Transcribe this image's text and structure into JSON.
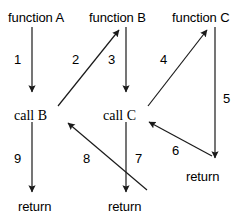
{
  "diagram": {
    "type": "call-sequence-flow",
    "background_color": "#ffffff",
    "stroke_color": "#1a1a1a",
    "text_color": "#000000",
    "nodes": [
      {
        "id": "function-a",
        "label": "function A",
        "x": 8,
        "y": 11,
        "font": "sans"
      },
      {
        "id": "function-b",
        "label": "function B",
        "x": 89,
        "y": 11,
        "font": "sans"
      },
      {
        "id": "function-c",
        "label": "function C",
        "x": 172,
        "y": 11,
        "font": "sans"
      },
      {
        "id": "call-b",
        "label": "call B",
        "x": 14,
        "y": 109,
        "font": "serif"
      },
      {
        "id": "call-c",
        "label": "call C",
        "x": 103,
        "y": 109,
        "font": "serif"
      },
      {
        "id": "return-left",
        "label": "return",
        "x": 18,
        "y": 200,
        "font": "sans"
      },
      {
        "id": "return-middle",
        "label": "return",
        "x": 108,
        "y": 200,
        "font": "sans"
      },
      {
        "id": "return-right",
        "label": "return",
        "x": 186,
        "y": 170,
        "font": "sans"
      }
    ],
    "edges": [
      {
        "id": "edge-1",
        "number": "1",
        "from": "function-a",
        "to": "call-b",
        "x1": 32,
        "y1": 27,
        "x2": 32,
        "y2": 92,
        "label_x": 14,
        "label_y": 53
      },
      {
        "id": "edge-2",
        "number": "2",
        "from": "call-b",
        "to": "function-b",
        "x1": 58,
        "y1": 106,
        "x2": 119,
        "y2": 30,
        "label_x": 72,
        "label_y": 53
      },
      {
        "id": "edge-3",
        "number": "3",
        "from": "function-b",
        "to": "call-c",
        "x1": 126,
        "y1": 27,
        "x2": 126,
        "y2": 92,
        "label_x": 108,
        "label_y": 53
      },
      {
        "id": "edge-4",
        "number": "4",
        "from": "call-c",
        "to": "function-c",
        "x1": 148,
        "y1": 106,
        "x2": 207,
        "y2": 30,
        "label_x": 160,
        "label_y": 53
      },
      {
        "id": "edge-5",
        "number": "5",
        "from": "function-c",
        "to": "return-right",
        "x1": 215,
        "y1": 27,
        "x2": 215,
        "y2": 158,
        "label_x": 223,
        "label_y": 92
      },
      {
        "id": "edge-6",
        "number": "6",
        "from": "return-right",
        "to": "call-c",
        "x1": 212,
        "y1": 156,
        "x2": 149,
        "y2": 122,
        "label_x": 172,
        "label_y": 144
      },
      {
        "id": "edge-7",
        "number": "7",
        "from": "call-c",
        "to": "return-middle",
        "x1": 126,
        "y1": 122,
        "x2": 126,
        "y2": 192,
        "label_x": 135,
        "label_y": 152
      },
      {
        "id": "edge-8",
        "number": "8",
        "from": "return-middle",
        "to": "call-b",
        "x1": 147,
        "y1": 190,
        "x2": 68,
        "y2": 123,
        "label_x": 83,
        "label_y": 152
      },
      {
        "id": "edge-9",
        "number": "9",
        "from": "call-b",
        "to": "return-left",
        "x1": 32,
        "y1": 122,
        "x2": 32,
        "y2": 192,
        "label_x": 14,
        "label_y": 152
      }
    ]
  }
}
